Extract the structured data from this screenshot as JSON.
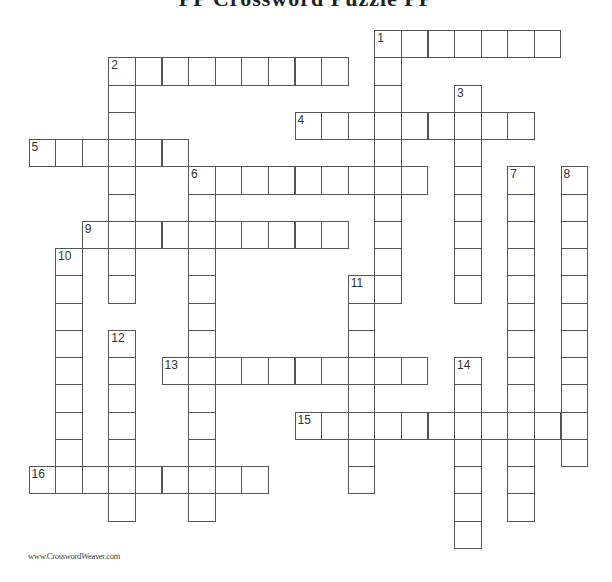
{
  "title": "PP Crossword Puzzle PP",
  "footer": "www.CrosswordWeaver.com",
  "entries": [
    {
      "number": "1",
      "direction": "across",
      "row": 0,
      "col": 13,
      "length": 7
    },
    {
      "number": "1",
      "direction": "down",
      "row": 0,
      "col": 13,
      "length": 10
    },
    {
      "number": "2",
      "direction": "across",
      "row": 1,
      "col": 3,
      "length": 9
    },
    {
      "number": "2",
      "direction": "down",
      "row": 1,
      "col": 3,
      "length": 9
    },
    {
      "number": "3",
      "direction": "down",
      "row": 2,
      "col": 16,
      "length": 8
    },
    {
      "number": "4",
      "direction": "across",
      "row": 3,
      "col": 10,
      "length": 9
    },
    {
      "number": "5",
      "direction": "across",
      "row": 4,
      "col": 0,
      "length": 6
    },
    {
      "number": "6",
      "direction": "across",
      "row": 5,
      "col": 6,
      "length": 9
    },
    {
      "number": "6",
      "direction": "down",
      "row": 5,
      "col": 6,
      "length": 13
    },
    {
      "number": "7",
      "direction": "down",
      "row": 5,
      "col": 18,
      "length": 13
    },
    {
      "number": "8",
      "direction": "down",
      "row": 5,
      "col": 20,
      "length": 11
    },
    {
      "number": "9",
      "direction": "across",
      "row": 7,
      "col": 2,
      "length": 10
    },
    {
      "number": "10",
      "direction": "down",
      "row": 8,
      "col": 1,
      "length": 9
    },
    {
      "number": "11",
      "direction": "down",
      "row": 9,
      "col": 12,
      "length": 8
    },
    {
      "number": "12",
      "direction": "down",
      "row": 11,
      "col": 3,
      "length": 7
    },
    {
      "number": "13",
      "direction": "across",
      "row": 12,
      "col": 5,
      "length": 10
    },
    {
      "number": "14",
      "direction": "down",
      "row": 12,
      "col": 16,
      "length": 7
    },
    {
      "number": "15",
      "direction": "across",
      "row": 14,
      "col": 10,
      "length": 11
    },
    {
      "number": "16",
      "direction": "across",
      "row": 16,
      "col": 0,
      "length": 9
    }
  ]
}
